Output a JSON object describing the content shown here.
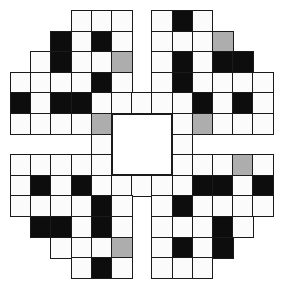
{
  "puzzle": {
    "type": "crossword-grid",
    "rows": 13,
    "cols": 13,
    "legend": {
      "W": "white",
      "B": "black",
      "G": "gray",
      ".": "none"
    },
    "colors": {
      "white": "#fbfbfb",
      "black": "#0d0d0d",
      "gray": "#adadad",
      "border": "#1a1a1a"
    },
    "grid": [
      "...WWW.WBW...",
      "..BWBW.WWWG..",
      ".WBWWG.WBWBB.",
      "WWWWBW.WBWWWW",
      "BWBBWWWWWBWBW",
      "WWWWG...WGWWW",
      "....W...W....",
      "WWWWW...WWWGW",
      "WBWBWWWWWBBWB",
      "WWWWBW.WBWWWW",
      ".BBWBW.WWWBW.",
      "..WWWG.WBWB..",
      "...WBW.WWW..."
    ],
    "center_block": {
      "row": 5,
      "col": 5,
      "rows": 3,
      "cols": 3
    }
  }
}
